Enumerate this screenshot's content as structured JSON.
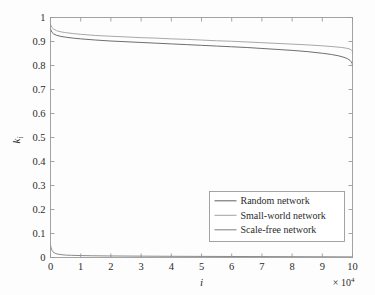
{
  "chart_data": {
    "type": "line",
    "title": "",
    "subtitle": "",
    "xlabel": "i",
    "ylabel": "k_i",
    "ylabel_base": "k",
    "ylabel_sub": "i",
    "x_multiplier_text": "× 10",
    "x_multiplier_exponent": "4",
    "x_multiplier_value": 10000,
    "xlim": [
      0,
      10
    ],
    "ylim": [
      0,
      1
    ],
    "xticks": [
      0,
      1,
      2,
      3,
      4,
      5,
      6,
      7,
      8,
      9,
      10
    ],
    "xtick_labels": [
      "0",
      "1",
      "2",
      "3",
      "4",
      "5",
      "6",
      "7",
      "8",
      "9",
      "10"
    ],
    "yticks": [
      0,
      0.1,
      0.2,
      0.3,
      0.4,
      0.5,
      0.6,
      0.7,
      0.8,
      0.9,
      1
    ],
    "ytick_labels": [
      "0",
      "0.1",
      "0.2",
      "0.3",
      "0.4",
      "0.5",
      "0.6",
      "0.7",
      "0.8",
      "0.9",
      "1"
    ],
    "grid": false,
    "legend_position": "lower-right",
    "background_color": "#fdfdfd",
    "frame_color": "#9a9a9a",
    "series": [
      {
        "name": "Random network",
        "color": "#6e6e6e",
        "x": [
          0.0,
          0.05,
          0.1,
          0.2,
          0.35,
          0.5,
          0.75,
          1.0,
          1.5,
          2.0,
          2.5,
          3.0,
          3.5,
          4.0,
          4.5,
          5.0,
          5.5,
          6.0,
          6.5,
          7.0,
          7.5,
          8.0,
          8.5,
          9.0,
          9.3,
          9.55,
          9.72,
          9.84,
          9.92,
          9.96,
          9.99,
          10.0
        ],
        "values": [
          0.952,
          0.938,
          0.932,
          0.926,
          0.921,
          0.918,
          0.914,
          0.911,
          0.906,
          0.902,
          0.899,
          0.896,
          0.893,
          0.89,
          0.887,
          0.884,
          0.881,
          0.878,
          0.875,
          0.871,
          0.867,
          0.863,
          0.858,
          0.851,
          0.846,
          0.84,
          0.834,
          0.828,
          0.821,
          0.815,
          0.808,
          0.8
        ]
      },
      {
        "name": "Small-world network",
        "color": "#a8a8a8",
        "x": [
          0.0,
          0.05,
          0.1,
          0.2,
          0.35,
          0.5,
          0.75,
          1.0,
          1.5,
          2.0,
          2.5,
          3.0,
          3.5,
          4.0,
          4.5,
          5.0,
          5.5,
          6.0,
          6.5,
          7.0,
          7.5,
          8.0,
          8.5,
          9.0,
          9.4,
          9.65,
          9.8,
          9.9,
          9.96,
          9.99,
          10.0
        ],
        "values": [
          0.972,
          0.958,
          0.952,
          0.945,
          0.94,
          0.937,
          0.933,
          0.93,
          0.925,
          0.922,
          0.919,
          0.916,
          0.914,
          0.911,
          0.909,
          0.906,
          0.903,
          0.901,
          0.898,
          0.895,
          0.892,
          0.889,
          0.886,
          0.882,
          0.878,
          0.875,
          0.872,
          0.869,
          0.865,
          0.861,
          0.856
        ]
      },
      {
        "name": "Scale-free network",
        "color": "#8a8a8a",
        "x": [
          0.0,
          0.02,
          0.05,
          0.08,
          0.12,
          0.18,
          0.25,
          0.35,
          0.5,
          0.7,
          1.0,
          1.4,
          1.9,
          2.5,
          3.2,
          4.0,
          5.0,
          6.0,
          7.0,
          8.0,
          9.0,
          10.0
        ],
        "values": [
          0.052,
          0.04,
          0.03,
          0.024,
          0.02,
          0.016,
          0.014,
          0.012,
          0.01,
          0.009,
          0.008,
          0.0072,
          0.0065,
          0.006,
          0.0055,
          0.005,
          0.0046,
          0.0042,
          0.0038,
          0.0034,
          0.003,
          0.0026
        ]
      }
    ]
  },
  "legend": {
    "entries": [
      {
        "label": "Random network"
      },
      {
        "label": "Small-world network"
      },
      {
        "label": "Scale-free network"
      }
    ]
  }
}
